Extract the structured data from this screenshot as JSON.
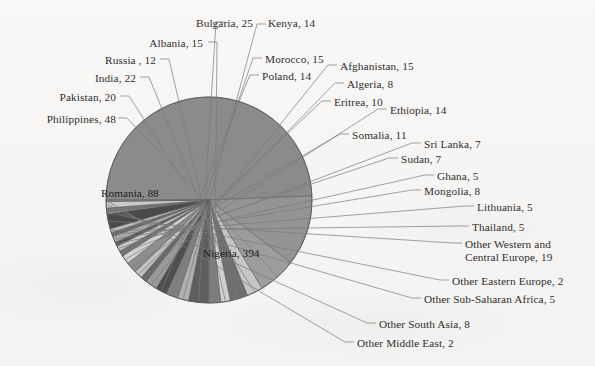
{
  "figure": {
    "background_color": "#f7f6f4",
    "leader_line_color": "#7a7a7a",
    "pie_outline_color": "#5a5a5a"
  },
  "chart_data": {
    "type": "pie",
    "title": "",
    "subtitle": "",
    "xlabel": "",
    "ylabel": "",
    "legend_position": "none",
    "grid": false,
    "label_format": "name, value",
    "total": 794,
    "start_angle_deg": 180,
    "direction": "clockwise",
    "categories": [
      "Nigeria",
      "Romania",
      "Philippines",
      "Pakistan",
      "India",
      "Russia ",
      "Albania",
      "Bulgaria",
      "Kenya",
      "Morocco",
      "Poland",
      "Afghanistan",
      "Algeria",
      "Eritrea",
      "Ethiopia",
      "Somalia",
      "Sri Lanka",
      "Sudan",
      "Ghana",
      "Mongolia",
      "Lithuania",
      "Thailand",
      "Other Western and Central Europe",
      "Other Eastern Europe",
      "Other Sub-Saharan Africa",
      "Other South Asia",
      "Other Middle East"
    ],
    "values": [
      394,
      88,
      48,
      20,
      22,
      12,
      15,
      25,
      14,
      15,
      14,
      15,
      8,
      10,
      14,
      11,
      7,
      7,
      5,
      8,
      5,
      5,
      19,
      2,
      5,
      8,
      2
    ],
    "slices": [
      {
        "name": "Nigeria",
        "value": 394,
        "label": "Nigeria, 394",
        "color": "#8b8b8b",
        "label_placement": "inside"
      },
      {
        "name": "Romania",
        "value": 88,
        "label": "Romania, 88",
        "color": "#949494",
        "label_placement": "inside"
      },
      {
        "name": "Philippines",
        "value": 48,
        "label": "Philippines, 48",
        "color": "#9d9d9d",
        "label_placement": "outside-left"
      },
      {
        "name": "Pakistan",
        "value": 20,
        "label": "Pakistan, 20",
        "color": "#c6c6c6",
        "label_placement": "outside-left"
      },
      {
        "name": "India",
        "value": 22,
        "label": "India, 22",
        "color": "#6f6f6f",
        "label_placement": "outside-left"
      },
      {
        "name": "Russia ",
        "value": 12,
        "label": "Russia , 12",
        "color": "#cfcfcf",
        "label_placement": "outside-left"
      },
      {
        "name": "Albania",
        "value": 15,
        "label": "Albania, 15",
        "color": "#7d7d7d",
        "label_placement": "outside-top"
      },
      {
        "name": "Bulgaria",
        "value": 25,
        "label": "Bulgaria, 25",
        "color": "#5e5e5e",
        "label_placement": "outside-top"
      },
      {
        "name": "Kenya",
        "value": 14,
        "label": "Kenya, 14",
        "color": "#b0b0b0",
        "label_placement": "outside-top"
      },
      {
        "name": "Morocco",
        "value": 15,
        "label": "Morocco, 15",
        "color": "#808080",
        "label_placement": "outside-top"
      },
      {
        "name": "Poland",
        "value": 14,
        "label": "Poland, 14",
        "color": "#4f4f4f",
        "label_placement": "outside-top"
      },
      {
        "name": "Afghanistan",
        "value": 15,
        "label": "Afghanistan, 15",
        "color": "#9a9a9a",
        "label_placement": "outside-right"
      },
      {
        "name": "Algeria",
        "value": 8,
        "label": "Algeria, 8",
        "color": "#686868",
        "label_placement": "outside-right"
      },
      {
        "name": "Eritrea",
        "value": 10,
        "label": "Eritrea, 10",
        "color": "#c2c2c2",
        "label_placement": "outside-right"
      },
      {
        "name": "Ethiopia",
        "value": 14,
        "label": "Ethiopia, 14",
        "color": "#8d8d8d",
        "label_placement": "outside-right"
      },
      {
        "name": "Somalia",
        "value": 11,
        "label": "Somalia, 11",
        "color": "#d2d2d2",
        "label_placement": "outside-right"
      },
      {
        "name": "Sri Lanka",
        "value": 7,
        "label": "Sri Lanka, 7",
        "color": "#747474",
        "label_placement": "outside-right"
      },
      {
        "name": "Sudan",
        "value": 7,
        "label": "Sudan, 7",
        "color": "#c9c9c9",
        "label_placement": "outside-right"
      },
      {
        "name": "Ghana",
        "value": 5,
        "label": "Ghana, 5",
        "color": "#595959",
        "label_placement": "outside-right"
      },
      {
        "name": "Mongolia",
        "value": 8,
        "label": "Mongolia, 8",
        "color": "#a8a8a8",
        "label_placement": "outside-right"
      },
      {
        "name": "Lithuania",
        "value": 5,
        "label": "Lithuania, 5",
        "color": "#6c6c6c",
        "label_placement": "outside-right"
      },
      {
        "name": "Thailand",
        "value": 5,
        "label": "Thailand, 5",
        "color": "#bdbdbd",
        "label_placement": "outside-right"
      },
      {
        "name": "Other Western and Central Europe",
        "value": 19,
        "label": "Other Western and Central Europe, 19",
        "color": "#4a4a4a",
        "label_placement": "outside-right"
      },
      {
        "name": "Other Eastern Europe",
        "value": 2,
        "label": "Other Eastern Europe, 2",
        "color": "#adadad",
        "label_placement": "outside-right"
      },
      {
        "name": "Other Sub-Saharan Africa",
        "value": 5,
        "label": "Other Sub-Saharan Africa, 5",
        "color": "#787878",
        "label_placement": "outside-right"
      },
      {
        "name": "Other South Asia",
        "value": 8,
        "label": "Other South Asia, 8",
        "color": "#cbcbcb",
        "label_placement": "outside-right"
      },
      {
        "name": "Other Middle East",
        "value": 2,
        "label": "Other Middle East, 2",
        "color": "#858585",
        "label_placement": "outside-right"
      }
    ]
  },
  "labels": {
    "philippines": "Philippines, 48",
    "pakistan": "Pakistan, 20",
    "india": "India, 22",
    "russia": "Russia , 12",
    "albania": "Albania, 15",
    "bulgaria": "Bulgaria, 25",
    "kenya": "Kenya, 14",
    "morocco": "Morocco, 15",
    "poland": "Poland, 14",
    "afghanistan": "Afghanistan, 15",
    "algeria": "Algeria, 8",
    "eritrea": "Eritrea, 10",
    "ethiopia": "Ethiopia, 14",
    "somalia": "Somalia, 11",
    "sri_lanka": "Sri Lanka, 7",
    "sudan": "Sudan, 7",
    "ghana": "Ghana, 5",
    "mongolia": "Mongolia, 8",
    "lithuania": "Lithuania, 5",
    "thailand": "Thailand, 5",
    "other_western_central_europe_l1": "Other Western and",
    "other_western_central_europe_l2": "Central Europe, 19",
    "other_eastern_europe": "Other Eastern Europe, 2",
    "other_sub_saharan_africa": "Other Sub-Saharan Africa, 5",
    "other_south_asia": "Other South Asia, 8",
    "other_middle_east": "Other Middle East, 2",
    "romania_inside": "Romania, 88",
    "nigeria_inside": "Nigeria, 394"
  }
}
